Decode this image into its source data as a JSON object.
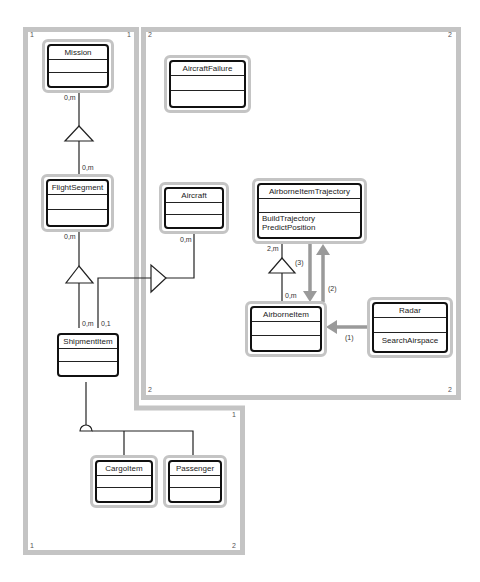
{
  "frames": [
    {
      "id": "1",
      "corner_labels": [
        "1",
        "1",
        "1",
        "1"
      ]
    },
    {
      "id": "2",
      "corner_labels": [
        "2",
        "2",
        "2",
        "2"
      ]
    }
  ],
  "classes": {
    "mission": {
      "name": "Mission",
      "operations": []
    },
    "flight_segment": {
      "name": "FlightSegment",
      "operations": []
    },
    "shipment_item": {
      "name": "ShipmentItem",
      "operations": []
    },
    "cargo_item": {
      "name": "CargoItem",
      "operations": []
    },
    "passenger": {
      "name": "Passenger",
      "operations": []
    },
    "aircraft_failure": {
      "name": "AircraftFailure",
      "operations": []
    },
    "aircraft": {
      "name": "Aircraft",
      "operations": []
    },
    "airborne_item_trajectory": {
      "name": "AirborneItemTrajectory",
      "operations": [
        "BuildTrajectory",
        "PredictPosition"
      ]
    },
    "airborne_item": {
      "name": "AirborneItem",
      "operations": []
    },
    "radar": {
      "name": "Radar",
      "operations": [
        "SearchAirspace"
      ]
    }
  },
  "multiplicities": {
    "mission_down": "0,m",
    "flightsegment_up": "0,m",
    "flightsegment_down": "0,m",
    "shipment_left": "0,m",
    "shipment_right": "0,1",
    "aircraft_down": "0,m",
    "trajectory_down": "2,m",
    "airborne_up": "0,m"
  },
  "messages": {
    "radar_to_airborne": "(1)",
    "airborne_to_trajectory": "(2)",
    "trajectory_to_airborne": "(3)"
  },
  "colors": {
    "frame": "#c4c4c4",
    "class_border": "#111111",
    "message_arrow": "#9a9a9a"
  }
}
